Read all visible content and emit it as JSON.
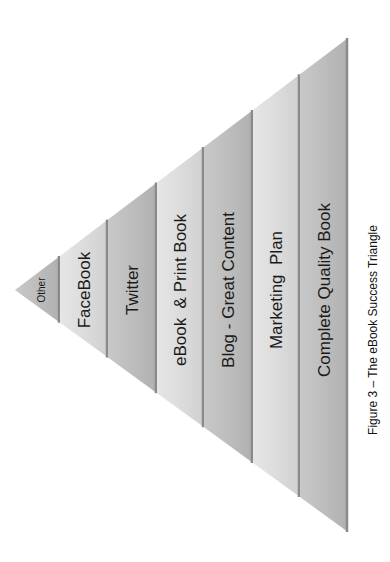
{
  "figure": {
    "caption": "Figure 3 – The eBook  Success Triangle",
    "apex": {
      "x": 15,
      "y": 290
    },
    "base_x": 348,
    "base_top_y": 38,
    "base_bottom_y": 532,
    "colors": {
      "band_dark": "#b9b9b9",
      "band_light": "#dcdcdc",
      "divider": "#8a8a8a",
      "text": "#1a1a1a"
    }
  },
  "bands": [
    {
      "label": "Other",
      "x0": 15,
      "x1": 60,
      "font_size": 10,
      "shade": "dark"
    },
    {
      "label": "FaceBook",
      "x0": 60,
      "x1": 108,
      "font_size": 17,
      "shade": "light"
    },
    {
      "label": "Twitter",
      "x0": 108,
      "x1": 157,
      "font_size": 17,
      "shade": "dark"
    },
    {
      "label": "eBook  & Print Book",
      "x0": 157,
      "x1": 204,
      "font_size": 17,
      "shade": "light"
    },
    {
      "label": "Blog - Great Content",
      "x0": 204,
      "x1": 253,
      "font_size": 17,
      "shade": "dark"
    },
    {
      "label": "Marketing  Plan",
      "x0": 253,
      "x1": 300,
      "font_size": 17,
      "shade": "light"
    },
    {
      "label": "Complete Quality Book",
      "x0": 300,
      "x1": 348,
      "font_size": 17,
      "shade": "dark"
    }
  ]
}
